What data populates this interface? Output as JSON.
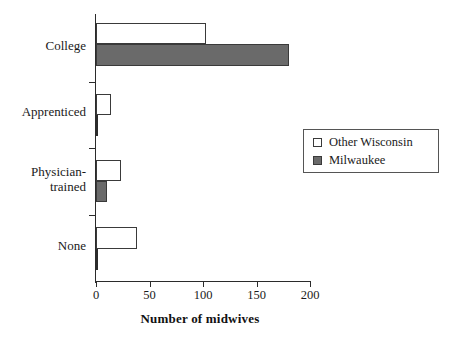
{
  "chart_data": {
    "type": "bar",
    "orientation": "horizontal",
    "title": "",
    "xlabel": "Number of midwives",
    "ylabel": "",
    "categories": [
      "College",
      "Apprenticed",
      "Physician-\ntrained",
      "None"
    ],
    "series": [
      {
        "name": "Other Wisconsin",
        "color": "#ffffff",
        "values": [
          103,
          14,
          23,
          38
        ]
      },
      {
        "name": "Milwaukee",
        "color": "#6a6a6a",
        "values": [
          180,
          1,
          10,
          1
        ]
      }
    ],
    "xlim": [
      0,
      200
    ],
    "xticks": [
      0,
      50,
      100,
      150,
      200
    ],
    "xtick_labels": [
      "0",
      "50",
      "100",
      "150",
      "200"
    ],
    "grid": false,
    "legend_position": "center-right",
    "legend_entries": [
      {
        "label": "Other Wisconsin",
        "swatch": "open-square"
      },
      {
        "label": "Milwaukee",
        "swatch": "filled-square"
      }
    ]
  },
  "axis": {
    "x_title": "Number of midwives"
  }
}
